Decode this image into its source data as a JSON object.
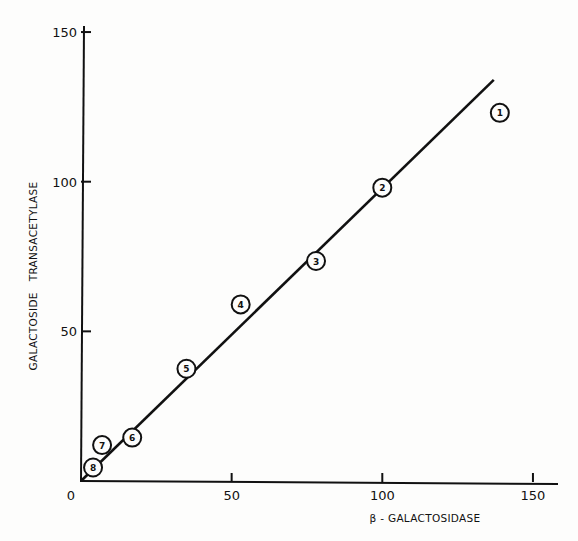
{
  "chart_data": {
    "type": "scatter",
    "title": "",
    "xlabel": "β - GALACTOSIDASE",
    "ylabel": "GALACTOSIDE   TRANSACETYLASE",
    "xlim": [
      0,
      160
    ],
    "ylim": [
      0,
      150
    ],
    "x_ticks": [
      0,
      50,
      100,
      150
    ],
    "y_ticks": [
      50,
      100,
      150
    ],
    "x_tick_labels": [
      "0",
      "50",
      "100",
      "150"
    ],
    "y_tick_labels": [
      "50",
      "100",
      "150"
    ],
    "grid": false,
    "legend": null,
    "points": [
      {
        "label": "1",
        "x": 139,
        "y": 123
      },
      {
        "label": "2",
        "x": 100,
        "y": 98
      },
      {
        "label": "3",
        "x": 78,
        "y": 73.5
      },
      {
        "label": "4",
        "x": 53,
        "y": 59
      },
      {
        "label": "5",
        "x": 35,
        "y": 37.5
      },
      {
        "label": "6",
        "x": 17,
        "y": 14.5
      },
      {
        "label": "7",
        "x": 7,
        "y": 12
      },
      {
        "label": "8",
        "x": 4,
        "y": 4.5
      }
    ],
    "fit_line": {
      "x": [
        0,
        137
      ],
      "y": [
        0,
        134
      ]
    }
  }
}
